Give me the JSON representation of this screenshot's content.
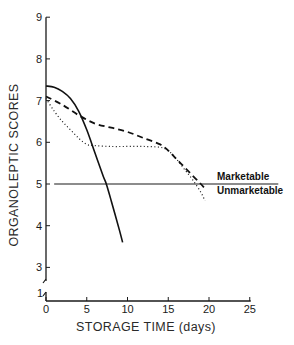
{
  "chart_data": {
    "type": "line",
    "title": "",
    "xlabel": "STORAGE TIME (days)",
    "ylabel": "ORGANOLEPTIC SCORES",
    "xlim": [
      0,
      25
    ],
    "ylim": [
      1,
      9
    ],
    "y_axis_break": true,
    "x_ticks": [
      0,
      5,
      10,
      15,
      20,
      25
    ],
    "x_tick_labels": [
      "0",
      "5",
      "10",
      "15",
      "20",
      "25"
    ],
    "y_ticks": [
      3,
      4,
      5,
      6,
      7,
      8,
      9
    ],
    "y_tick_labels": [
      "3",
      "4",
      "5",
      "6",
      "7",
      "8",
      "9"
    ],
    "y_origin_label": "1",
    "grid": false,
    "legend": null,
    "series": [
      {
        "name": "solid",
        "style": "solid",
        "x": [
          0,
          1,
          2,
          3,
          4,
          5,
          6,
          7,
          7.4,
          8,
          9,
          9.4
        ],
        "y": [
          7.35,
          7.32,
          7.22,
          7.05,
          6.75,
          6.3,
          5.75,
          5.2,
          5.0,
          4.6,
          3.9,
          3.6
        ]
      },
      {
        "name": "dashed",
        "style": "dashed",
        "x": [
          0,
          2,
          4,
          6,
          8,
          10,
          12,
          14,
          15,
          16,
          17,
          18,
          19,
          19.7
        ],
        "y": [
          7.1,
          6.9,
          6.65,
          6.45,
          6.35,
          6.25,
          6.1,
          5.95,
          5.8,
          5.6,
          5.4,
          5.2,
          5.0,
          4.85
        ]
      },
      {
        "name": "dotted",
        "style": "dotted",
        "x": [
          0,
          1,
          2,
          3,
          4,
          5,
          6,
          8,
          10,
          12,
          14,
          15,
          16,
          17,
          18,
          19,
          19.5
        ],
        "y": [
          7.05,
          6.75,
          6.5,
          6.3,
          6.1,
          5.95,
          5.92,
          5.9,
          5.9,
          5.9,
          5.88,
          5.8,
          5.6,
          5.35,
          5.1,
          4.8,
          4.6
        ]
      }
    ],
    "reference_lines": [
      {
        "y": 5,
        "x_range": [
          1,
          28.5
        ],
        "label_above": "Marketable",
        "label_below": "Unmarketable"
      }
    ]
  }
}
